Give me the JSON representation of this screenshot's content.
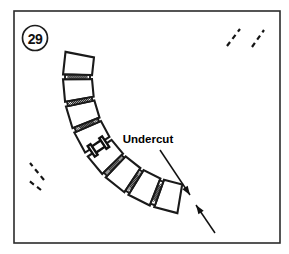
{
  "figure": {
    "number": "29",
    "callout_label": "Undercut",
    "colors": {
      "background": "#ffffff",
      "line": "#1a1a1a",
      "frame": "#2b2b2b",
      "text": "#000000"
    }
  },
  "frame": {
    "x": 14,
    "y": 11,
    "width": 266,
    "height": 232
  },
  "figure_number_badge": {
    "cx": 35,
    "cy": 38,
    "r": 12.5
  },
  "callout": {
    "text_x": 148,
    "text_y": 143,
    "leader_from_x": 160,
    "leader_from_y": 150,
    "leader_to_x": 190,
    "leader_to_y": 195,
    "arrow2_from_x": 215,
    "arrow2_from_y": 233,
    "arrow2_to_x": 196,
    "arrow2_to_y": 205
  },
  "arc": {
    "center_x": 200,
    "center_y": 78,
    "inner_radius": 108,
    "outer_radius": 137,
    "start_angle_deg": 96,
    "end_angle_deg": 188,
    "segment_count": 8,
    "joint_count": 7,
    "undercut_joint_index": 3
  },
  "segments": [
    {
      "name": "segment-1-top-right",
      "a0": 99.5,
      "a1": 109.5
    },
    {
      "name": "segment-2",
      "a0": 111.5,
      "a1": 121.5
    },
    {
      "name": "segment-3",
      "a0": 123.5,
      "a1": 133.5
    },
    {
      "name": "segment-4",
      "a0": 135.5,
      "a1": 145.0
    },
    {
      "name": "segment-5-undercut-right",
      "a0": 147.0,
      "a1": 156.5
    },
    {
      "name": "segment-6",
      "a0": 158.5,
      "a1": 168.0
    },
    {
      "name": "segment-7",
      "a0": 170.0,
      "a1": 179.5
    },
    {
      "name": "segment-8-bottom-left",
      "a0": 181.5,
      "a1": 191.0
    }
  ],
  "joints": [
    {
      "name": "joint-1",
      "a0": 109.5,
      "a1": 111.5,
      "style": "hatched"
    },
    {
      "name": "joint-2",
      "a0": 121.5,
      "a1": 123.5,
      "style": "hatched"
    },
    {
      "name": "joint-3",
      "a0": 133.5,
      "a1": 135.5,
      "style": "hatched"
    },
    {
      "name": "joint-4-undercut",
      "a0": 145.0,
      "a1": 147.0,
      "style": "undercut"
    },
    {
      "name": "joint-5",
      "a0": 156.5,
      "a1": 158.5,
      "style": "hatched"
    },
    {
      "name": "joint-6",
      "a0": 168.0,
      "a1": 170.0,
      "style": "hatched"
    },
    {
      "name": "joint-7",
      "a0": 179.5,
      "a1": 181.5,
      "style": "hatched"
    }
  ],
  "break_lines": [
    {
      "name": "break-line-top-outer",
      "x1": 252,
      "y1": 47,
      "x2": 264,
      "y2": 30
    },
    {
      "name": "break-line-top-inner",
      "x1": 227,
      "y1": 46,
      "x2": 240,
      "y2": 29
    },
    {
      "name": "break-line-left-outer",
      "x1": 44,
      "y1": 180,
      "x2": 30,
      "y2": 163
    },
    {
      "name": "break-line-left-inner",
      "x1": 41,
      "y1": 190,
      "x2": 28,
      "y2": 180
    }
  ]
}
